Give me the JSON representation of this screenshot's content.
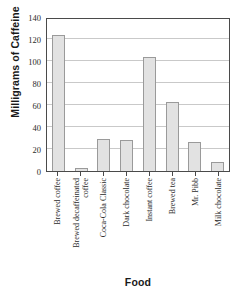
{
  "chart_data": {
    "type": "bar",
    "title": "",
    "xlabel": "Food",
    "ylabel": "Milligrams of Caffeine",
    "categories": [
      "Brewed coffee",
      "Brewed decaffeinated coffee",
      "Coca-Cola Classic",
      "Dark chocolate",
      "Instant coffee",
      "Brewed tea",
      "Mr. Pibb",
      "Milk chocolate"
    ],
    "values": [
      124,
      3,
      29,
      28,
      104,
      63,
      26,
      8
    ],
    "ylim": [
      0,
      140
    ],
    "ytick_labels": [
      "0",
      "20",
      "40",
      "60",
      "80",
      "100",
      "120",
      "140"
    ],
    "ytick_values": [
      0,
      20,
      40,
      60,
      80,
      100,
      120,
      140
    ],
    "grid": true,
    "grid_axis": "y",
    "legend": false,
    "legend_position": "none",
    "bar_fill_color": "#e2e2e2",
    "bar_edge_color": "#9a9a9a",
    "axis_color": "#4a4a4a",
    "grid_color": "#c9c9c9",
    "background_color": "#ffffff"
  }
}
